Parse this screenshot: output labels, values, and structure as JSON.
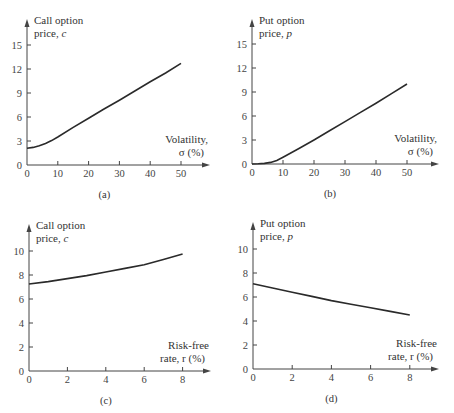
{
  "chart_data": [
    {
      "id": "a",
      "type": "line",
      "caption": "(a)",
      "ylabel_line1": "Call option",
      "ylabel_line2": "price, c",
      "xlabel_line1": "Volatility,",
      "xlabel_line2": "σ (%)",
      "xticks": [
        0,
        10,
        20,
        30,
        40,
        50
      ],
      "yticks": [
        0,
        3,
        6,
        9,
        12,
        15
      ],
      "xlim": [
        0,
        58
      ],
      "ylim": [
        0,
        18
      ],
      "x": [
        0,
        2,
        4,
        6,
        8,
        10,
        15,
        20,
        25,
        30,
        35,
        40,
        45,
        50
      ],
      "y": [
        2.1,
        2.2,
        2.4,
        2.7,
        3.05,
        3.5,
        4.7,
        5.85,
        7.0,
        8.1,
        9.25,
        10.4,
        11.5,
        12.7
      ],
      "frame": {
        "ox": 27,
        "oy": 165,
        "px_per_x": 3.08,
        "px_per_y": 8.0,
        "x_end": 210,
        "y_top": 19
      }
    },
    {
      "id": "b",
      "type": "line",
      "caption": "(b)",
      "ylabel_line1": "Put option",
      "ylabel_line2": "price, p",
      "xlabel_line1": "Volatility,",
      "xlabel_line2": "σ (%)",
      "xticks": [
        0,
        10,
        20,
        30,
        40,
        50
      ],
      "yticks": [
        0,
        3,
        6,
        9,
        12,
        15
      ],
      "xlim": [
        0,
        58
      ],
      "ylim": [
        0,
        18
      ],
      "x": [
        0,
        2,
        4,
        6,
        8,
        10,
        15,
        20,
        25,
        30,
        35,
        40,
        45,
        50
      ],
      "y": [
        0.0,
        0.02,
        0.08,
        0.2,
        0.45,
        0.85,
        1.9,
        3.0,
        4.15,
        5.3,
        6.45,
        7.6,
        8.8,
        10.0
      ],
      "frame": {
        "ox": 252,
        "oy": 164,
        "px_per_x": 3.1,
        "px_per_y": 8.0,
        "x_end": 439,
        "y_top": 19
      }
    },
    {
      "id": "c",
      "type": "line",
      "caption": "(c)",
      "ylabel_line1": "Call option",
      "ylabel_line2": "price, c",
      "xlabel_line1": "Risk-free",
      "xlabel_line2": "rate, r (%)",
      "xticks": [
        0,
        2,
        4,
        6,
        8
      ],
      "yticks": [
        0,
        2,
        4,
        6,
        8,
        10
      ],
      "xlim": [
        0,
        9.5
      ],
      "ylim": [
        0,
        12
      ],
      "x": [
        0,
        1,
        2,
        3,
        4,
        5,
        6,
        7,
        8
      ],
      "y": [
        7.25,
        7.45,
        7.7,
        7.95,
        8.25,
        8.55,
        8.85,
        9.3,
        9.75
      ],
      "frame": {
        "ox": 29,
        "oy": 371,
        "px_per_x": 19.2,
        "px_per_y": 12.0,
        "x_end": 211,
        "y_top": 224
      }
    },
    {
      "id": "d",
      "type": "line",
      "caption": "(d)",
      "ylabel_line1": "Put option",
      "ylabel_line2": "price, p",
      "xlabel_line1": "Risk-free",
      "xlabel_line2": "rate, r (%)",
      "xticks": [
        0,
        2,
        4,
        6,
        8
      ],
      "yticks": [
        0,
        2,
        4,
        6,
        8,
        10
      ],
      "xlim": [
        0,
        9.5
      ],
      "ylim": [
        0,
        12
      ],
      "x": [
        0,
        1,
        2,
        3,
        4,
        5,
        6,
        7,
        8
      ],
      "y": [
        7.1,
        6.75,
        6.4,
        6.05,
        5.7,
        5.4,
        5.1,
        4.8,
        4.5
      ],
      "frame": {
        "ox": 253,
        "oy": 369,
        "px_per_x": 19.6,
        "px_per_y": 12.0,
        "x_end": 439,
        "y_top": 222
      }
    }
  ]
}
